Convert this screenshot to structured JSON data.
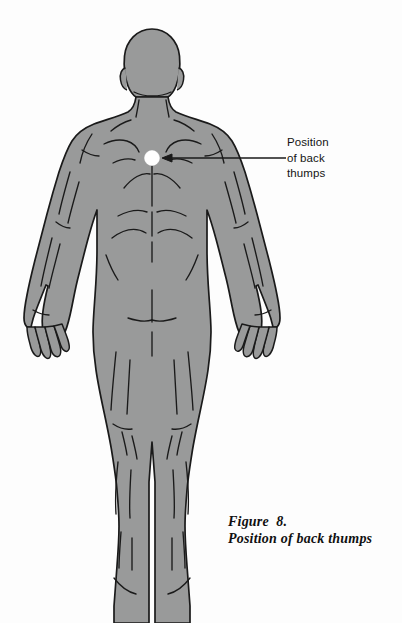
{
  "figure": {
    "background_color": "#fdfdfd",
    "body_fill_color": "#999a9a",
    "outline_color": "#1a1a1a",
    "marker_fill_color": "#ffffff",
    "caption": {
      "line1": "Figure  8.",
      "line2": "Position of back thumps"
    },
    "callout": {
      "text": "Position\nof back\nthumps",
      "line1": "Position",
      "line2": "of back",
      "line3": "thumps",
      "marker_label": "back-thumps-point",
      "marker_x": 152,
      "marker_y": 158,
      "marker_radius": 7.5,
      "leader_from_x": 163,
      "leader_to_x": 286,
      "leader_y": 158
    }
  }
}
